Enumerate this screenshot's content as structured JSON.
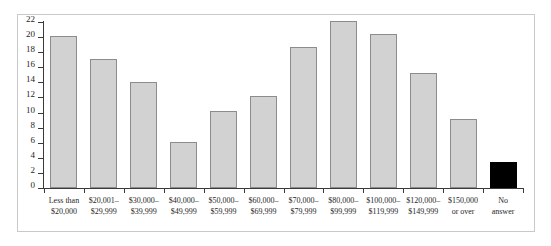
{
  "chart_data": {
    "type": "bar",
    "title": "",
    "subtitle": "",
    "xlabel": "",
    "ylabel": "",
    "ylim": [
      0,
      22
    ],
    "ytick_step": 2,
    "grid": false,
    "legend": "none",
    "yticks": [
      "22",
      "20",
      "18",
      "16",
      "14",
      "12",
      "10",
      "8",
      "6",
      "4",
      "2",
      "0"
    ],
    "categories": [
      "Less than $20,000",
      "$20,001–$29,999",
      "$30,000–$39,999",
      "$40,000–$49,999",
      "$50,000–$59,999",
      "$60,000–$69,999",
      "$70,000–$79,999",
      "$80,000–$99,999",
      "$100,000–$119,999",
      "$120,000–$149,999",
      "$150,000 or over",
      "No answer"
    ],
    "category_lines": [
      [
        "Less than",
        "$20,000"
      ],
      [
        "$20,001–",
        "$29,999"
      ],
      [
        "$30,000–",
        "$39,999"
      ],
      [
        "$40,000–",
        "$49,999"
      ],
      [
        "$50,000–",
        "$59,999"
      ],
      [
        "$60,000–",
        "$69,999"
      ],
      [
        "$70,000–",
        "$79,999"
      ],
      [
        "$80,000–",
        "$99,999"
      ],
      [
        "$100,000–",
        "$119,999"
      ],
      [
        "$120,000–",
        "$149,999"
      ],
      [
        "$150,000",
        "or over"
      ],
      [
        "No",
        "answer"
      ]
    ],
    "values": [
      20.1,
      17.1,
      14.1,
      6.1,
      10.2,
      12.2,
      18.7,
      22.2,
      20.4,
      15.3,
      9.2,
      3.5
    ],
    "bar_colors": [
      "#d2d2d2",
      "#d2d2d2",
      "#d2d2d2",
      "#d2d2d2",
      "#d2d2d2",
      "#d2d2d2",
      "#d2d2d2",
      "#d2d2d2",
      "#d2d2d2",
      "#d2d2d2",
      "#d2d2d2",
      "#000000"
    ],
    "bar_border_color": "#8c8c8c",
    "axis_color": "#3a3a3a",
    "frame_color": "#c9c9c9",
    "background": "#ffffff"
  }
}
